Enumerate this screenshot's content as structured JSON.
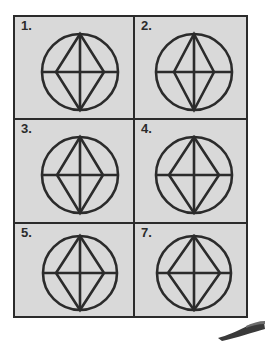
{
  "page": {
    "background_color": "#ffffff",
    "plate_fill_color": "#d9d9d9",
    "ink_color": "#2b2b2b"
  },
  "grid": {
    "columns": 2,
    "rows": 3,
    "cells": [
      {
        "label": "1.",
        "figure": {
          "shape_name": "circle-with-inscribed-rhombus",
          "circle_radius": 38,
          "rhombus_half_width": 24,
          "rhombus_half_height": 38,
          "has_vertical_diameter": true,
          "has_horizontal_diameter": true
        }
      },
      {
        "label": "2.",
        "figure": {
          "shape_name": "circle-with-inscribed-rhombus",
          "circle_radius": 38,
          "rhombus_half_width": 20,
          "rhombus_half_height": 38,
          "has_vertical_diameter": true,
          "has_horizontal_diameter": true
        }
      },
      {
        "label": "3.",
        "figure": {
          "shape_name": "circle-with-inscribed-rhombus",
          "circle_radius": 38,
          "rhombus_half_width": 23,
          "rhombus_half_height": 38,
          "has_vertical_diameter": true,
          "has_horizontal_diameter": true
        }
      },
      {
        "label": "4.",
        "figure": {
          "shape_name": "circle-with-inscribed-rhombus",
          "circle_radius": 38,
          "rhombus_half_width": 25,
          "rhombus_half_height": 38,
          "has_vertical_diameter": true,
          "has_horizontal_diameter": true
        }
      },
      {
        "label": "5.",
        "figure": {
          "shape_name": "circle-with-inscribed-rhombus",
          "circle_radius": 37,
          "rhombus_half_width": 24,
          "rhombus_half_height": 37,
          "has_vertical_diameter": true,
          "has_horizontal_diameter": true
        }
      },
      {
        "label": "7.",
        "figure": {
          "shape_name": "circle-with-inscribed-rhombus",
          "circle_radius": 37,
          "rhombus_half_width": 26,
          "rhombus_half_height": 37,
          "has_vertical_diameter": true,
          "has_horizontal_diameter": true
        }
      }
    ]
  }
}
